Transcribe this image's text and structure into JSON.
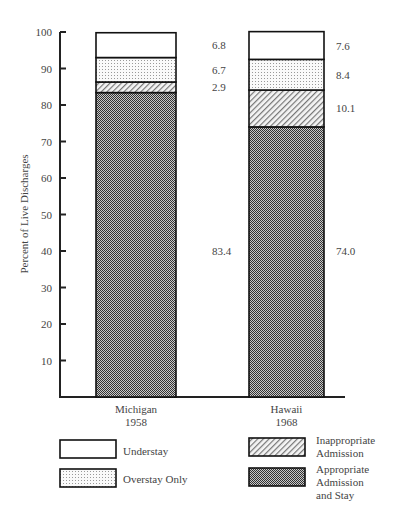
{
  "chart_data": {
    "type": "bar",
    "stacked": true,
    "title": "",
    "xlabel": "",
    "ylabel": "Percent of Live Discharges",
    "ylim": [
      0,
      100
    ],
    "yticks": [
      10,
      20,
      30,
      40,
      50,
      60,
      70,
      80,
      90,
      100
    ],
    "categories": [
      "Michigan 1958",
      "Hawaii 1968"
    ],
    "category_lines": [
      [
        "Michigan",
        "1958"
      ],
      [
        "Hawaii",
        "1968"
      ]
    ],
    "series": [
      {
        "name": "Appropriate Admission and Stay",
        "values": [
          83.4,
          74.0
        ],
        "pattern": "dense-dots"
      },
      {
        "name": "Inappropriate Admission",
        "values": [
          2.9,
          10.1
        ],
        "pattern": "hatch"
      },
      {
        "name": "Overstay Only",
        "values": [
          6.7,
          8.4
        ],
        "pattern": "light-dots"
      },
      {
        "name": "Understay",
        "values": [
          6.8,
          7.6
        ],
        "pattern": "blank"
      }
    ],
    "value_labels": [
      [
        "83.4",
        "2.9",
        "6.7",
        "6.8"
      ],
      [
        "74.0",
        "10.1",
        "8.4",
        "7.6"
      ]
    ],
    "grid": false,
    "legend_position": "bottom"
  },
  "legend": {
    "items": [
      {
        "lines": [
          "Understay"
        ],
        "pattern": "blank"
      },
      {
        "lines": [
          "Overstay Only"
        ],
        "pattern": "light-dots"
      },
      {
        "lines": [
          "Inappropriate",
          "Admission"
        ],
        "pattern": "hatch"
      },
      {
        "lines": [
          "Appropriate",
          "Admission",
          "and Stay"
        ],
        "pattern": "dense-dots"
      }
    ]
  }
}
